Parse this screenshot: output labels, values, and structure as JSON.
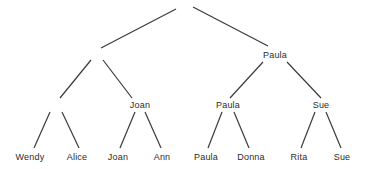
{
  "diagram": {
    "type": "tournament-tree",
    "root": {
      "label": "",
      "children": [
        {
          "label": "",
          "children": [
            {
              "label": "",
              "children": [
                {
                  "label": "Wendy"
                },
                {
                  "label": "Alice"
                }
              ]
            },
            {
              "label": "Joan",
              "children": [
                {
                  "label": "Joan"
                },
                {
                  "label": "Ann"
                }
              ]
            }
          ]
        },
        {
          "label": "Paula",
          "children": [
            {
              "label": "Paula",
              "children": [
                {
                  "label": "Paula"
                },
                {
                  "label": "Donna"
                }
              ]
            },
            {
              "label": "Sue",
              "children": [
                {
                  "label": "Rita"
                },
                {
                  "label": "Sue"
                }
              ]
            }
          ]
        }
      ]
    },
    "nodes": {
      "level1_right": "Paula",
      "level2_joan": "Joan",
      "level2_paula": "Paula",
      "level2_sue": "Sue",
      "leaf_wendy": "Wendy",
      "leaf_alice": "Alice",
      "leaf_joan": "Joan",
      "leaf_ann": "Ann",
      "leaf_paula": "Paula",
      "leaf_donna": "Donna",
      "leaf_rita": "Rita",
      "leaf_sue": "Sue"
    },
    "edge_color": "#3a3a3a",
    "text_color": "#2b2b2b"
  }
}
